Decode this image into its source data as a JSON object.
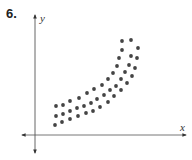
{
  "problem": {
    "number": "6."
  },
  "chart_data": {
    "type": "scatter",
    "title": "",
    "xlabel": "x",
    "ylabel": "y",
    "grid": false,
    "legend": null,
    "axes": {
      "style": "cartesian-arrows",
      "ticks": false
    },
    "colors": {
      "points": "#444444",
      "axes": "#555555"
    },
    "points": [
      [
        55,
        125
      ],
      [
        62,
        122
      ],
      [
        70,
        119
      ],
      [
        78,
        116
      ],
      [
        86,
        113
      ],
      [
        93,
        111
      ],
      [
        100,
        107
      ],
      [
        108,
        102
      ],
      [
        114,
        96
      ],
      [
        121,
        90
      ],
      [
        127,
        83
      ],
      [
        132,
        76
      ],
      [
        135,
        68
      ],
      [
        137,
        58
      ],
      [
        138,
        48
      ],
      [
        56,
        116
      ],
      [
        63,
        114
      ],
      [
        70,
        111
      ],
      [
        77,
        108
      ],
      [
        84,
        106
      ],
      [
        91,
        103
      ],
      [
        97,
        99
      ],
      [
        104,
        95
      ],
      [
        110,
        90
      ],
      [
        116,
        86
      ],
      [
        121,
        79
      ],
      [
        125,
        72
      ],
      [
        129,
        65
      ],
      [
        131,
        56
      ],
      [
        56,
        106
      ],
      [
        63,
        105
      ],
      [
        70,
        101
      ],
      [
        79,
        98
      ],
      [
        87,
        93
      ],
      [
        94,
        89
      ],
      [
        102,
        85
      ],
      [
        108,
        79
      ],
      [
        113,
        73
      ],
      [
        117,
        66
      ],
      [
        119,
        58
      ],
      [
        122,
        50
      ],
      [
        122,
        41
      ],
      [
        131,
        40
      ]
    ]
  }
}
